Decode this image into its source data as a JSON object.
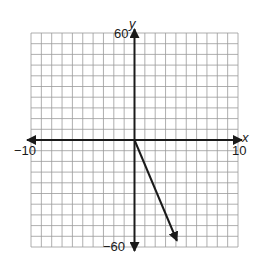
{
  "chart_data": {
    "type": "line",
    "title": "",
    "xlabel": "x",
    "ylabel": "y",
    "xlim": [
      -10,
      10
    ],
    "ylim": [
      -60,
      60
    ],
    "x_grid_step": 1,
    "y_grid_step": 6,
    "grid": true,
    "tick_labels": {
      "x_min": "−10",
      "x_max": "10",
      "y_max": "60",
      "y_min": "−60"
    },
    "series": [
      {
        "name": "ray",
        "points": [
          [
            0,
            0
          ],
          [
            4.1,
            -56.5
          ]
        ],
        "arrow_end": true
      }
    ]
  },
  "labels": {
    "y_axis": "y",
    "x_axis": "x",
    "y_top": "60",
    "y_bottom": "−60",
    "x_left": "−10",
    "x_right": "10"
  },
  "colors": {
    "grid": "#9a9a9a",
    "axis": "#1a1a1a",
    "line": "#1a1a1a",
    "background": "#ffffff"
  }
}
